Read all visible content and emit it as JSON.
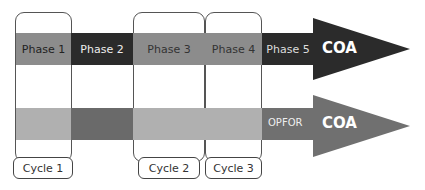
{
  "colors": {
    "light_gray": "#8c8c8c",
    "dark": "#2b2b2b",
    "lower_light": "#b0b0b0",
    "lower_dark": "#6a6a6a",
    "opfor_arrow": "#707070"
  },
  "top_arrow": {
    "phases": [
      {
        "label": "Phase 1"
      },
      {
        "label": "Phase 2"
      },
      {
        "label": "Phase 3"
      },
      {
        "label": "Phase 4"
      },
      {
        "label": "Phase 5"
      }
    ],
    "head_label": "COA"
  },
  "bottom_arrow": {
    "prefix_label": "OPFOR",
    "head_label": "COA"
  },
  "cycles": [
    {
      "label": "Cycle 1"
    },
    {
      "label": "Cycle 2"
    },
    {
      "label": "Cycle 3"
    }
  ]
}
